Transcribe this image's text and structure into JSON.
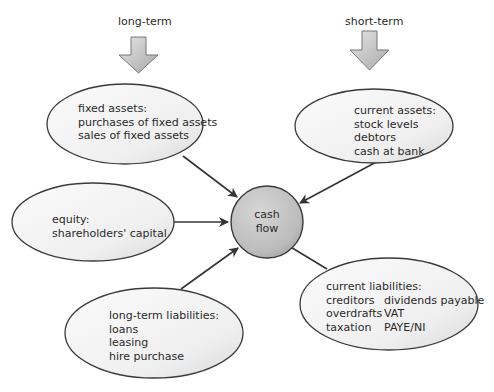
{
  "top_labels": {
    "long_term": "long-term",
    "short_term": "short-term"
  },
  "center": {
    "line1": "cash",
    "line2": "flow"
  },
  "nodes": {
    "fixed_assets": {
      "title": "fixed assets:",
      "items": [
        "purchases of fixed assets",
        "sales of fixed assets"
      ]
    },
    "current_assets": {
      "title": "current assets:",
      "items": [
        "stock levels",
        "debtors",
        "cash at bank"
      ]
    },
    "equity": {
      "title": "equity:",
      "items": [
        "shareholders' capital"
      ]
    },
    "long_term_liabilities": {
      "title": "long-term liabilities:",
      "items": [
        "loans",
        "leasing",
        "hire purchase"
      ]
    },
    "current_liabilities": {
      "title": "current liabilities:",
      "rows": [
        [
          "creditors",
          "dividends payable"
        ],
        [
          "overdrafts",
          "VAT"
        ],
        [
          "taxation",
          "PAYE/NI"
        ]
      ]
    }
  },
  "colors": {
    "ellipse_fill": "#f2f2f2",
    "ellipse_stroke": "#3a3a3a",
    "circle_fill": "#bdbdbd",
    "arrow_fill": "#c8c8c8",
    "connector": "#333333"
  }
}
